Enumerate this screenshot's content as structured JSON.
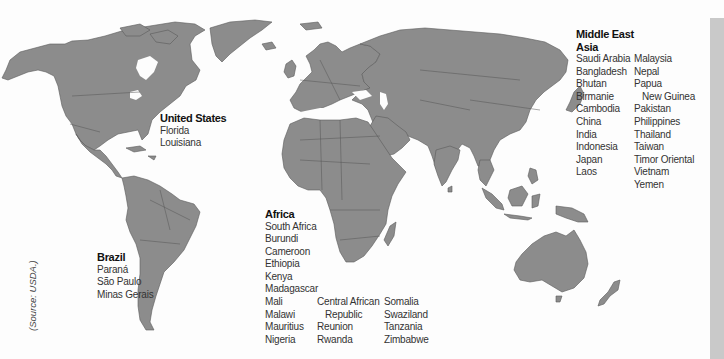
{
  "map": {
    "background": "#fdfdfd",
    "land_color": "#8c8c8c",
    "border_color": "#555555",
    "side_strip_color": "#c9c9c9",
    "source_note": "(Source: USDA.)"
  },
  "regions": {
    "united_states": {
      "title": "United States",
      "locations": [
        "Florida",
        "Louisiana"
      ]
    },
    "brazil": {
      "title": "Brazil",
      "locations": [
        "Paraná",
        "São Paulo",
        "Minas Gerais"
      ]
    },
    "africa": {
      "title": "Africa",
      "column1": [
        "South Africa",
        "Burundi",
        "Cameroon",
        "Ethiopia",
        "Kenya",
        "Madagascar",
        "Mali",
        "Malawi",
        "Mauritius",
        "Nigeria"
      ],
      "column2": [
        "Central African",
        "Republic",
        "Reunion",
        "Rwanda"
      ],
      "column3": [
        "Somalia",
        "Swaziland",
        "Tanzania",
        "Zimbabwe"
      ]
    },
    "middle_east_asia": {
      "title_line1": "Middle East",
      "title_line2": "Asia",
      "column1": [
        "Saudi Arabia",
        "Bangladesh",
        "Bhutan",
        "Birmanie",
        "Cambodia",
        "China",
        "India",
        "Indonesia",
        "Japan",
        "Laos"
      ],
      "column2": [
        "Malaysia",
        "Nepal",
        "Papua",
        "New Guinea",
        "Pakistan",
        "Philippines",
        "Thailand",
        "Taiwan",
        "Timor Oriental",
        "Vietnam",
        "Yemen"
      ]
    }
  }
}
